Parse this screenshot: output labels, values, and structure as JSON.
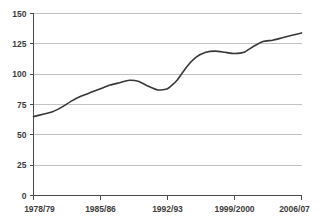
{
  "chart_data": {
    "type": "line",
    "title": "",
    "xlabel": "",
    "ylabel": "",
    "ylim": [
      0,
      150
    ],
    "yticks": [
      0,
      25,
      50,
      75,
      100,
      125,
      150
    ],
    "ytick_labels": [
      "0",
      "25",
      "50",
      "75",
      "100",
      "125",
      "150"
    ],
    "grid": "horizontal",
    "legend": "none",
    "xtick_labels": [
      "1978/79",
      "1985/86",
      "1992/93",
      "1999/2000",
      "2006/07"
    ],
    "xtick_indices": [
      0,
      7,
      14,
      21,
      28
    ],
    "x": [
      "1978/79",
      "1979/80",
      "1980/81",
      "1981/82",
      "1982/83",
      "1983/84",
      "1984/85",
      "1985/86",
      "1986/87",
      "1987/88",
      "1988/89",
      "1989/90",
      "1990/91",
      "1991/92",
      "1992/93",
      "1993/94",
      "1994/95",
      "1995/96",
      "1996/97",
      "1997/98",
      "1998/99",
      "1999/2000",
      "2000/01",
      "2001/02",
      "2002/03",
      "2003/04",
      "2004/05",
      "2005/06",
      "2006/07"
    ],
    "series": [
      {
        "name": "series-1",
        "color": "#38383a",
        "values": [
          65,
          67,
          69,
          73,
          78,
          82,
          85,
          88,
          91,
          93,
          95,
          94,
          90,
          87,
          88,
          95,
          106,
          114,
          118,
          119,
          118,
          117,
          118,
          123,
          127,
          128,
          130,
          132,
          134
        ]
      }
    ]
  },
  "axes": {
    "y_axis_name": "y-axis",
    "x_axis_name": "x-axis"
  }
}
